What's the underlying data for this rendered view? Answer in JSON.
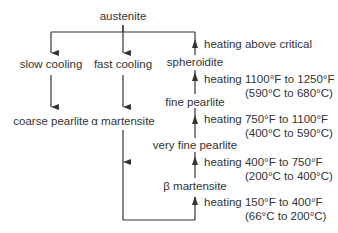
{
  "diagram": {
    "root": "austenite",
    "left_branch": {
      "process": "slow cooling",
      "result": "coarse pearlite"
    },
    "middle_branch": {
      "process": "fast cooling",
      "result": "α martensite"
    },
    "tempering_chain": [
      {
        "state": "β martensite",
        "heating_line1": "heating 150°F to 400°F",
        "heating_line2": "(66°C to 200°C)"
      },
      {
        "state": "very fine pearlite",
        "heating_line1": "heating 400°F to 750°F",
        "heating_line2": "(200°C to 400°C)"
      },
      {
        "state": "fine pearlite",
        "heating_line1": "heating 750°F to 1100°F",
        "heating_line2": "(400°C to 590°C)"
      },
      {
        "state": "spheroidite",
        "heating_line1": "heating 1100°F to 1250°F",
        "heating_line2": "(590°C to 680°C)"
      }
    ],
    "top_heating": "heating above critical"
  },
  "colors": {
    "line": "#333333",
    "text": "#333333"
  }
}
